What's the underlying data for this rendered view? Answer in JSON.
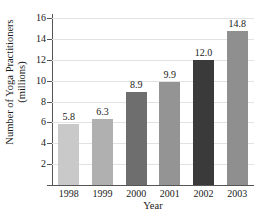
{
  "chart_data": {
    "type": "bar",
    "title": "",
    "xlabel": "Year",
    "ylabel_line1": "Number of Yoga Practitioners",
    "ylabel_line2": "(millions)",
    "categories": [
      "1998",
      "1999",
      "2000",
      "2001",
      "2002",
      "2003"
    ],
    "values": [
      5.8,
      6.3,
      8.9,
      9.9,
      12.0,
      14.8
    ],
    "value_labels": [
      "5.8",
      "6.3",
      "8.9",
      "9.9",
      "12.0",
      "14.8"
    ],
    "ylim": [
      0,
      16
    ],
    "yticks": [
      0,
      2,
      4,
      6,
      8,
      10,
      12,
      14,
      16
    ],
    "ytick_labels": [
      "",
      "2",
      "4",
      "6",
      "8",
      "10",
      "12",
      "14",
      "16"
    ],
    "grid": true,
    "legend": "none",
    "bar_colors": [
      "#c9c9c9",
      "#b0b0b0",
      "#6e6e6e",
      "#949494",
      "#3a3a3a",
      "#8f8f8f"
    ],
    "bar_patterns": [
      "solid",
      "diagonal-hatch",
      "solid",
      "solid",
      "solid",
      "solid"
    ]
  }
}
